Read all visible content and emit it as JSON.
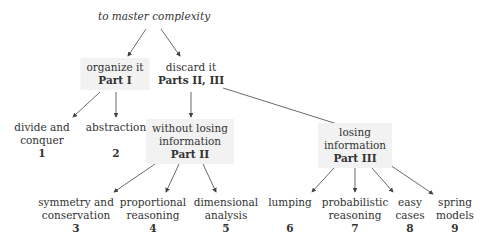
{
  "root": {
    "label": "to master complexity"
  },
  "organize": {
    "line1": "organize it",
    "part": "Part I"
  },
  "discard": {
    "line1": "discard it",
    "part": "Parts II, III"
  },
  "without": {
    "line1": "without losing",
    "line2": "information",
    "part": "Part II"
  },
  "losing": {
    "line1": "losing",
    "line2": "information",
    "part": "Part III"
  },
  "leaves": [
    {
      "line1": "divide and",
      "line2": "conquer",
      "num": "1"
    },
    {
      "line1": "abstraction",
      "line2": "",
      "num": "2"
    },
    {
      "line1": "symmetry and",
      "line2": "conservation",
      "num": "3"
    },
    {
      "line1": "proportional",
      "line2": "reasoning",
      "num": "4"
    },
    {
      "line1": "dimensional",
      "line2": "analysis",
      "num": "5"
    },
    {
      "line1": "lumping",
      "line2": "",
      "num": "6"
    },
    {
      "line1": "probabilistic",
      "line2": "reasoning",
      "num": "7"
    },
    {
      "line1": "easy",
      "line2": "cases",
      "num": "8"
    },
    {
      "line1": "spring",
      "line2": "models",
      "num": "9"
    }
  ],
  "colors": {
    "box_bg": "#f2f2f2",
    "arrow": "#444444",
    "text": "#333333"
  }
}
